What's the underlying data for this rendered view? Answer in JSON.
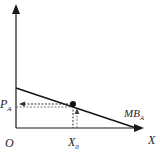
{
  "diagram": {
    "type": "economics-marginal-benefit",
    "labels": {
      "y_price": "P",
      "y_price_sub": "A",
      "origin": "O",
      "x_quantity": "X",
      "x_quantity_sub": "0",
      "x_axis": "X",
      "curve": "MB",
      "curve_sub": "A"
    },
    "colors": {
      "axis": "#1a1a1a",
      "curve": "#1a1a1a",
      "guide": "#333333",
      "background": "#ffffff"
    },
    "geometry": {
      "origin": [
        16,
        128
      ],
      "y_axis_top": [
        16,
        6
      ],
      "x_axis_end": [
        142,
        128
      ],
      "curve_start": [
        16,
        88
      ],
      "curve_end": [
        136,
        128
      ],
      "point": [
        73,
        104
      ]
    }
  }
}
